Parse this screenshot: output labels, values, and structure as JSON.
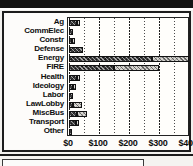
{
  "figure": {
    "type": "horizontal-bar-chart",
    "frame_label": "campaign-contributions-by-sector"
  },
  "chart_data": {
    "type": "bar",
    "orientation": "horizontal",
    "stacked": true,
    "title": "",
    "xlabel": "",
    "ylabel": "",
    "xlim": [
      0,
      400
    ],
    "xticks": [
      0,
      100,
      200,
      300,
      400
    ],
    "xtick_labels": [
      "$0",
      "$100",
      "$200",
      "$300",
      "$400"
    ],
    "minor_gridline_step": 50,
    "grid": true,
    "legend": "none",
    "categories": [
      "Ag",
      "CommElec",
      "Constr",
      "Defense",
      "Energy",
      "FIRE",
      "Health",
      "Ideology",
      "Labor",
      "LawLobby",
      "MiscBus",
      "Transport",
      "Other"
    ],
    "series": [
      {
        "name": "segment-dark",
        "fill": "dark-crosshatch",
        "values": [
          25,
          12,
          10,
          48,
          275,
          150,
          25,
          13,
          13,
          13,
          25,
          22,
          5
        ]
      },
      {
        "name": "segment-light",
        "fill": "light-dotted",
        "values": [
          13,
          0,
          8,
          0,
          125,
          150,
          13,
          11,
          0,
          32,
          35,
          10,
          0
        ]
      }
    ],
    "totals": [
      38,
      12,
      18,
      48,
      400,
      300,
      38,
      24,
      13,
      45,
      60,
      32,
      5
    ],
    "colors": {
      "dark_segment": "#3b3b3b",
      "light_segment": "#d8d6d1",
      "outline": "#121212",
      "plot_background": "#fffefb",
      "figure_background": "#fdfcfa",
      "gridline": "#4a4a4a",
      "text": "#0d0d0d"
    }
  }
}
